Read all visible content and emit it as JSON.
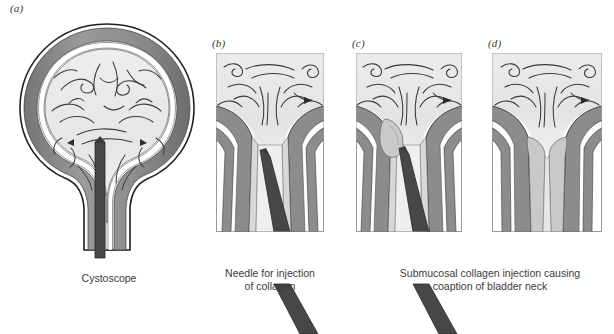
{
  "figure": {
    "background_color": "#ffffff"
  },
  "palette": {
    "outline": "#1a1a1a",
    "muscle_gray": "#8e8e8e",
    "muscle_gray_dark": "#6f6f6f",
    "submucosa_white": "#ffffff",
    "mucosa_light": "#e4e4e4",
    "lumen_light": "#efefef",
    "collagen_gray": "#c9c9c9",
    "instrument_dark": "#474747",
    "panel_border": "#9a9a9a",
    "text": "#3a3a3a"
  },
  "panels": [
    {
      "id": "a",
      "label": "(a)",
      "caption": "Cystoscope",
      "structure": "whole-bladder-with-cystoscope",
      "has_frame": false,
      "x": 14,
      "y": 18,
      "width": 186,
      "height": 240,
      "caption_x": 24,
      "caption_y": 272,
      "caption_width": 170
    },
    {
      "id": "b",
      "label": "(b)",
      "caption": "Needle for injection\nof collagen",
      "structure": "bladder-neck-with-needle",
      "has_frame": true,
      "x": 216,
      "y": 53,
      "width": 108,
      "height": 179,
      "caption_x": 190,
      "caption_y": 267,
      "caption_width": 160
    },
    {
      "id": "c",
      "label": "(c)",
      "caption": "Submucosal collagen injection causing\ncoaption of bladder neck",
      "structure": "bladder-neck-with-collagen-bolus",
      "has_frame": true,
      "x": 356,
      "y": 53,
      "width": 106,
      "height": 179,
      "caption_x": 368,
      "caption_y": 267,
      "caption_width": 244
    },
    {
      "id": "d",
      "label": "(d)",
      "caption": "",
      "structure": "coapted-bladder-neck",
      "has_frame": true,
      "x": 492,
      "y": 53,
      "width": 110,
      "height": 179,
      "caption_x": 0,
      "caption_y": 0,
      "caption_width": 0
    }
  ],
  "anatomy_labels": {
    "bladder_wall": "bladder-wall",
    "bladder_lumen": "bladder-lumen",
    "mucosal_folds": "mucosal-folds",
    "bladder_neck": "bladder-neck",
    "urethra": "urethra",
    "cystoscope": "cystoscope",
    "needle": "needle",
    "collagen_bolus": "collagen-bolus"
  }
}
